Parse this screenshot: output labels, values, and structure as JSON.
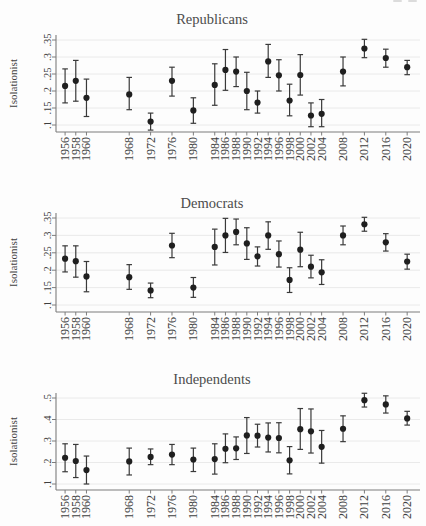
{
  "page": {
    "background": "#fdfdfd"
  },
  "colors": {
    "marker": "#1f1f1f",
    "error_bar": "#3a3a3a",
    "axis": "#7d7d7d",
    "grid": "#e4e4e4",
    "tick_label": "#3f3f3f",
    "title": "#4c4c4c"
  },
  "chart_data": [
    {
      "type": "scatter",
      "title": "Republicans",
      "ylabel": "Isolationist",
      "xlabel": "",
      "legend": "none",
      "grid": true,
      "error_bars": "95% confidence intervals",
      "xlim": [
        1954.3,
        2022.4
      ],
      "ylim": [
        0.1,
        0.35
      ],
      "yticks": [
        0.1,
        0.15,
        0.2,
        0.25,
        0.3,
        0.35
      ],
      "ytick_labels": [
        ".1",
        ".15",
        ".2",
        ".25",
        ".3",
        ".35"
      ],
      "x": [
        1956,
        1958,
        1960,
        1968,
        1972,
        1976,
        1980,
        1984,
        1986,
        1988,
        1990,
        1992,
        1994,
        1996,
        1998,
        2000,
        2002,
        2004,
        2008,
        2012,
        2016,
        2020
      ],
      "series": [
        {
          "name": "Proportion isolationist (Republicans)",
          "values": [
            0.215,
            0.23,
            0.18,
            0.19,
            0.11,
            0.23,
            0.143,
            0.218,
            0.262,
            0.257,
            0.2,
            0.166,
            0.287,
            0.246,
            0.172,
            0.247,
            0.128,
            0.133,
            0.257,
            0.325,
            0.297,
            0.27
          ],
          "ci_low": [
            0.165,
            0.17,
            0.125,
            0.145,
            0.085,
            0.185,
            0.105,
            0.158,
            0.202,
            0.213,
            0.145,
            0.135,
            0.24,
            0.2,
            0.127,
            0.188,
            0.095,
            0.095,
            0.215,
            0.298,
            0.27,
            0.248
          ],
          "ci_high": [
            0.265,
            0.29,
            0.235,
            0.24,
            0.135,
            0.27,
            0.18,
            0.28,
            0.322,
            0.3,
            0.255,
            0.2,
            0.337,
            0.292,
            0.22,
            0.307,
            0.165,
            0.175,
            0.3,
            0.352,
            0.323,
            0.29
          ]
        }
      ]
    },
    {
      "type": "scatter",
      "title": "Democrats",
      "ylabel": "Isolationist",
      "xlabel": "",
      "legend": "none",
      "grid": true,
      "error_bars": "95% confidence intervals",
      "xlim": [
        1954.3,
        2022.4
      ],
      "ylim": [
        0.1,
        0.35
      ],
      "yticks": [
        0.1,
        0.15,
        0.2,
        0.25,
        0.3,
        0.35
      ],
      "ytick_labels": [
        ".1",
        ".15",
        ".2",
        ".25",
        ".3",
        ".35"
      ],
      "x": [
        1956,
        1958,
        1960,
        1968,
        1972,
        1976,
        1980,
        1984,
        1986,
        1988,
        1990,
        1992,
        1994,
        1996,
        1998,
        2000,
        2002,
        2004,
        2008,
        2012,
        2016,
        2020
      ],
      "series": [
        {
          "name": "Proportion isolationist (Democrats)",
          "values": [
            0.233,
            0.226,
            0.182,
            0.18,
            0.142,
            0.271,
            0.15,
            0.267,
            0.3,
            0.31,
            0.277,
            0.24,
            0.3,
            0.246,
            0.172,
            0.259,
            0.21,
            0.194,
            0.3,
            0.332,
            0.28,
            0.225
          ],
          "ci_low": [
            0.195,
            0.18,
            0.138,
            0.145,
            0.121,
            0.236,
            0.122,
            0.215,
            0.251,
            0.273,
            0.231,
            0.212,
            0.26,
            0.209,
            0.136,
            0.21,
            0.178,
            0.159,
            0.273,
            0.312,
            0.255,
            0.203
          ],
          "ci_high": [
            0.27,
            0.27,
            0.225,
            0.216,
            0.163,
            0.306,
            0.179,
            0.318,
            0.349,
            0.347,
            0.322,
            0.267,
            0.339,
            0.284,
            0.207,
            0.309,
            0.243,
            0.23,
            0.327,
            0.352,
            0.305,
            0.246
          ]
        }
      ]
    },
    {
      "type": "scatter",
      "title": "Independents",
      "ylabel": "Isolationist",
      "xlabel": "",
      "legend": "none",
      "grid": true,
      "error_bars": "95% confidence intervals",
      "xlim": [
        1954.3,
        2022.4
      ],
      "ylim": [
        0.1,
        0.5
      ],
      "yticks": [
        0.1,
        0.2,
        0.3,
        0.4,
        0.5
      ],
      "ytick_labels": [
        ".1",
        ".2",
        ".3",
        ".4",
        ".5"
      ],
      "x": [
        1956,
        1958,
        1960,
        1968,
        1972,
        1976,
        1980,
        1984,
        1986,
        1988,
        1990,
        1992,
        1994,
        1996,
        1998,
        2000,
        2002,
        2004,
        2008,
        2012,
        2016,
        2020
      ],
      "series": [
        {
          "name": "Proportion isolationist (Independents)",
          "values": [
            0.222,
            0.207,
            0.165,
            0.205,
            0.226,
            0.237,
            0.214,
            0.216,
            0.264,
            0.266,
            0.326,
            0.325,
            0.316,
            0.314,
            0.21,
            0.355,
            0.345,
            0.273,
            0.357,
            0.49,
            0.47,
            0.405
          ],
          "ci_low": [
            0.157,
            0.13,
            0.1,
            0.142,
            0.19,
            0.19,
            0.158,
            0.146,
            0.199,
            0.214,
            0.242,
            0.272,
            0.249,
            0.245,
            0.147,
            0.261,
            0.244,
            0.197,
            0.297,
            0.458,
            0.43,
            0.374
          ],
          "ci_high": [
            0.287,
            0.284,
            0.23,
            0.267,
            0.263,
            0.284,
            0.267,
            0.287,
            0.333,
            0.319,
            0.409,
            0.378,
            0.384,
            0.385,
            0.274,
            0.451,
            0.449,
            0.349,
            0.417,
            0.522,
            0.51,
            0.438
          ]
        }
      ]
    }
  ]
}
